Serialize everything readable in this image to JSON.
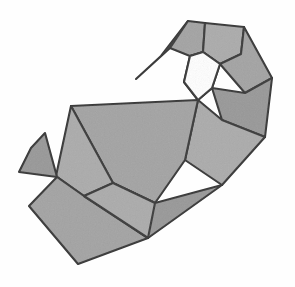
{
  "figure": {
    "title": "Polygonal mesh shape",
    "canvas": {
      "width": 295,
      "height": 287
    },
    "colors": {
      "background": "#fefefe",
      "face_fill": "#a3a3a3",
      "face_fill_dark": "#989898",
      "face_fill_light": "#ababab",
      "stroke": "#3b3b3b",
      "hole_fill": "#fefefe"
    },
    "render": {
      "stroke_width": 2.1,
      "sliver_stroke_width": 1.6,
      "noise_opacity": 0.3
    }
  },
  "mesh": {
    "name": "hook-polygon-mesh",
    "face_count": 12,
    "faces": [
      {
        "id": "face-top-spike",
        "name": "top-left-spike-face",
        "shade": "dark",
        "points": "188,21 170,48 136,79 161,56"
      },
      {
        "id": "face-top-left",
        "name": "top-left-facet",
        "shade": "normal",
        "points": "188,21 205,23 203,52 190,56 170,48"
      },
      {
        "id": "face-top-right",
        "name": "top-right-facet",
        "shade": "light",
        "points": "205,23 244,27 241,54 220,64 203,52"
      },
      {
        "id": "face-right-upper",
        "name": "right-upper-facet",
        "shade": "normal",
        "points": "244,27 272,78 245,93 220,64 241,54"
      },
      {
        "id": "face-right-mid",
        "name": "right-middle-facet",
        "shade": "dark",
        "points": "272,78 265,137 222,120 212,88 245,93"
      },
      {
        "id": "face-inner-left",
        "name": "inner-left-facet",
        "shade": "normal",
        "points": "203,52 190,56 184,82 198,100 212,88 220,64"
      },
      {
        "id": "face-right-lower",
        "name": "right-lower-facet",
        "shade": "light",
        "points": "265,137 222,185 185,160 198,100 222,120"
      },
      {
        "id": "face-body-main",
        "name": "main-body-facet",
        "shade": "normal",
        "points": "71,106 198,100 185,160 155,203 113,183"
      },
      {
        "id": "face-body-lower",
        "name": "lower-body-facet",
        "shade": "dark",
        "points": "222,185 155,203 113,183 148,238"
      },
      {
        "id": "face-mid-left",
        "name": "middle-left-facet",
        "shade": "light",
        "points": "71,106 113,183 84,196 56,176"
      },
      {
        "id": "face-tail-spike",
        "name": "tail-spike-facet",
        "shade": "dark",
        "points": "45,133 57,177 19,172 31,148"
      },
      {
        "id": "face-tail-lower",
        "name": "tail-lower-facet",
        "shade": "normal",
        "points": "57,177 84,196 148,238 78,264 29,206"
      },
      {
        "id": "face-tail-inner",
        "name": "tail-inner-facet",
        "shade": "light",
        "points": "84,196 113,183 155,203 148,238"
      }
    ],
    "hole": {
      "id": "interior-hole",
      "name": "interior-white-hole",
      "points": "190,56 184,82 198,100 212,88 220,64 203,52"
    },
    "vertices": [
      {
        "name": "apex-top",
        "x": 188,
        "y": 21
      },
      {
        "name": "top-right-ridge",
        "x": 205,
        "y": 23
      },
      {
        "name": "upper-right-corner",
        "x": 244,
        "y": 27
      },
      {
        "name": "right-shoulder",
        "x": 272,
        "y": 78
      },
      {
        "name": "right-extreme",
        "x": 265,
        "y": 137
      },
      {
        "name": "right-lower-corner",
        "x": 222,
        "y": 185
      },
      {
        "name": "notch-vertex",
        "x": 155,
        "y": 203
      },
      {
        "name": "bottom-right-corner",
        "x": 148,
        "y": 238
      },
      {
        "name": "bottom-left-corner",
        "x": 78,
        "y": 264
      },
      {
        "name": "tail-left-tip",
        "x": 19,
        "y": 172
      },
      {
        "name": "tail-top-tip",
        "x": 45,
        "y": 133
      },
      {
        "name": "body-left-corner",
        "x": 71,
        "y": 106
      },
      {
        "name": "spike-tip-left",
        "x": 136,
        "y": 79
      }
    ]
  }
}
